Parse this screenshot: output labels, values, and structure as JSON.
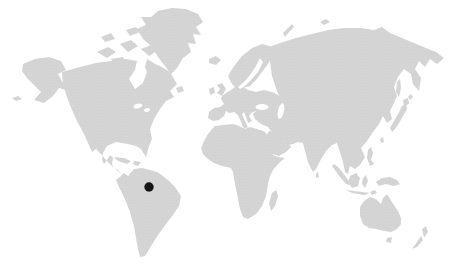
{
  "map": {
    "label": "world-map-with-location-marker",
    "marker": {
      "x": 149,
      "y": 187,
      "r": 4.7,
      "region": "south-america-amazon"
    },
    "colors": {
      "background": "#ffffff",
      "land": "#d3d3d3",
      "land_texture": "#dedede",
      "water": "#ffffff",
      "marker": "#141414"
    },
    "canvas": {
      "width": 475,
      "height": 277
    }
  }
}
